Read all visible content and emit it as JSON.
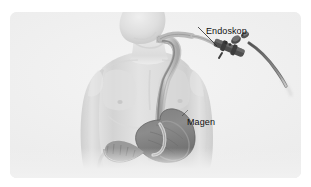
{
  "illustration": {
    "title": "Gastroskopie",
    "language": "de",
    "style": "grayscale medical illustration",
    "background_color": "#eeeeee",
    "frame_color": "#ffffff",
    "labels": [
      {
        "id": "endoskop",
        "text": "Endoskop",
        "color": "#111111",
        "points_to": "endoscope-handle"
      },
      {
        "id": "magen",
        "text": "Magen",
        "color": "#111111",
        "points_to": "stomach"
      }
    ],
    "anatomy": {
      "body": "male torso, head turned, arms at sides",
      "skin_tone": "#d9d9d9",
      "organs": [
        {
          "name": "esophagus",
          "tone": "#c9c9c9"
        },
        {
          "name": "stomach",
          "tone": "#8f8f8f"
        },
        {
          "name": "duodenum",
          "tone": "#9a9a9a"
        }
      ]
    },
    "device": {
      "name": "endoscope",
      "handle_tone": "#4a4a4a",
      "cable_tone": "#6b6b6b",
      "insertion_tube_tone": "#b6b6b6"
    }
  }
}
